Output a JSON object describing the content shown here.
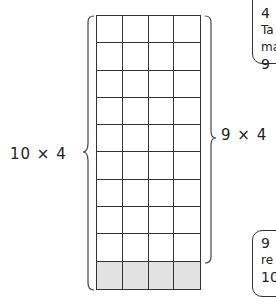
{
  "diagram": {
    "grid": {
      "rows": 10,
      "columns": 4,
      "shaded_row": 10,
      "shade_color": "#e2e2e2",
      "line_color": "#333333"
    },
    "left_label": "10 × 4",
    "right_label": "9 × 4",
    "callout_top": {
      "lines": [
        "4",
        "Ta",
        "ma",
        "9"
      ]
    },
    "callout_bottom": {
      "lines": [
        "9",
        "re",
        "10"
      ]
    }
  }
}
